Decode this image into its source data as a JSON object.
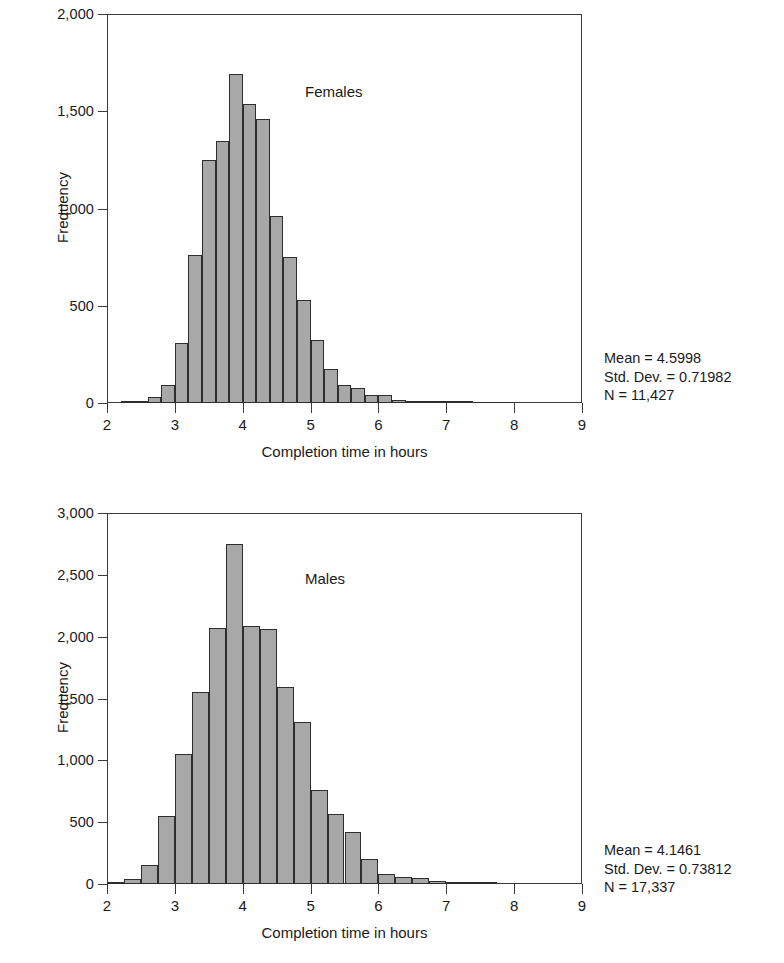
{
  "chart_data": [
    {
      "type": "bar",
      "id": "females",
      "title": "",
      "annotation": "Females",
      "xlabel": "Completion time in hours",
      "ylabel": "Frequency",
      "xlim": [
        2,
        9
      ],
      "ylim": [
        0,
        2000
      ],
      "xticks": [
        "2",
        "3",
        "4",
        "5",
        "6",
        "7",
        "8",
        "9"
      ],
      "xtick_values": [
        2,
        3,
        4,
        5,
        6,
        7,
        8,
        9
      ],
      "yticks": [
        "0",
        "500",
        "1,000",
        "1,500",
        "2,000"
      ],
      "ytick_values": [
        0,
        500,
        1000,
        1500,
        2000
      ],
      "grid": false,
      "bin_width": 0.2,
      "bin_starts": [
        2.2,
        2.4,
        2.6,
        2.8,
        3.0,
        3.2,
        3.4,
        3.6,
        3.8,
        4.0,
        4.2,
        4.4,
        4.6,
        4.8,
        5.0,
        5.2,
        5.4,
        5.6,
        5.8,
        6.0,
        6.2,
        6.4,
        6.6,
        6.8,
        7.0,
        7.2,
        7.4,
        7.6,
        7.8
      ],
      "values": [
        8,
        12,
        30,
        95,
        310,
        760,
        1250,
        1345,
        1690,
        1535,
        1460,
        960,
        750,
        530,
        325,
        175,
        95,
        75,
        40,
        40,
        18,
        8,
        5,
        3,
        2,
        1,
        0,
        0,
        0
      ],
      "stats": {
        "mean_label": "Mean = 4.5998",
        "std_label": "Std. Dev. = 0.71982",
        "n_label": "N = 11,427",
        "mean": 4.5998,
        "std_dev": 0.71982,
        "n": 11427
      }
    },
    {
      "type": "bar",
      "id": "males",
      "title": "",
      "annotation": "Males",
      "xlabel": "Completion time in hours",
      "ylabel": "Frequency",
      "xlim": [
        2,
        9
      ],
      "ylim": [
        0,
        3000
      ],
      "xticks": [
        "2",
        "3",
        "4",
        "5",
        "6",
        "7",
        "8",
        "9"
      ],
      "xtick_values": [
        2,
        3,
        4,
        5,
        6,
        7,
        8,
        9
      ],
      "yticks": [
        "0",
        "500",
        "1,000",
        "1,500",
        "2,000",
        "2,500",
        "3,000"
      ],
      "ytick_values": [
        0,
        500,
        1000,
        1500,
        2000,
        2500,
        3000
      ],
      "grid": false,
      "bin_width": 0.25,
      "bin_starts": [
        2.0,
        2.25,
        2.5,
        2.75,
        3.0,
        3.25,
        3.5,
        3.75,
        4.0,
        4.25,
        4.5,
        4.75,
        5.0,
        5.25,
        5.5,
        5.75,
        6.0,
        6.25,
        6.5,
        6.75,
        7.0,
        7.25,
        7.5
      ],
      "values": [
        15,
        40,
        150,
        550,
        1050,
        1550,
        2070,
        2750,
        2090,
        2060,
        1595,
        1310,
        760,
        570,
        420,
        205,
        80,
        55,
        45,
        25,
        8,
        4,
        2
      ],
      "stats": {
        "mean_label": "Mean = 4.1461",
        "std_label": "Std. Dev. = 0.73812",
        "n_label": "N = 17,337",
        "mean": 4.1461,
        "std_dev": 0.73812,
        "n": 17337
      }
    }
  ],
  "colors": {
    "bar_fill": "#a8a8a8",
    "bar_stroke": "#2e2e2e",
    "axis": "#3a3a3a",
    "text": "#1a1a1a",
    "background": "#ffffff"
  }
}
